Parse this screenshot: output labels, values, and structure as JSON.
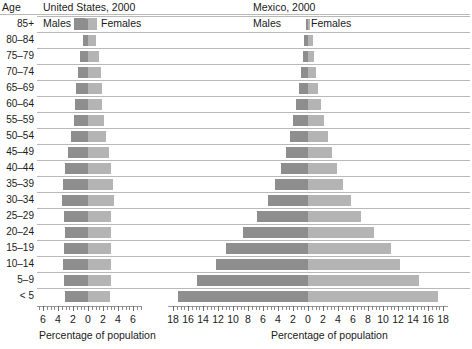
{
  "header": {
    "age_column_label": "Age",
    "left_title": "United States, 2000",
    "right_title": "Mexico, 2000"
  },
  "legend": {
    "left_males": "Males",
    "left_females": "Females",
    "right_males": "Males",
    "right_females": "Females",
    "male_color": "#8e8e8e",
    "female_color": "#b4b4b4"
  },
  "axis": {
    "left_title": "Percentage of population",
    "right_title": "Percentage of population",
    "left_tick_labels": [
      "6",
      "4",
      "2",
      "0",
      "2",
      "4",
      "6"
    ],
    "right_tick_labels": [
      "18",
      "16",
      "14",
      "12",
      "10",
      "8",
      "6",
      "4",
      "2",
      "0",
      "2",
      "4",
      "6",
      "8",
      "10",
      "12",
      "14",
      "16",
      "18"
    ],
    "left_limit": 7,
    "right_limit": 18,
    "tick_step": 2,
    "minor_tick_step": 0.5
  },
  "chart_data": {
    "type": "bar",
    "xlabel": "Percentage of population",
    "ylabel": "Age",
    "grid": true,
    "legend_position": "top",
    "categories": [
      "85+",
      "80–84",
      "75–79",
      "70–74",
      "65–69",
      "60–64",
      "55–59",
      "50–54",
      "45–49",
      "40–44",
      "35–39",
      "30–34",
      "25–29",
      "20–24",
      "15–19",
      "10–14",
      "5–9",
      "< 5"
    ],
    "panels": [
      {
        "name": "United States, 2000",
        "xlim": [
          -7,
          7
        ],
        "series": [
          {
            "name": "Males",
            "values": [
              0.5,
              0.7,
              1.1,
              1.4,
              1.6,
              1.7,
              1.9,
              2.3,
              2.7,
              3.1,
              3.3,
              3.5,
              3.2,
              3.1,
              3.2,
              3.3,
              3.2,
              3.1
            ]
          },
          {
            "name": "Females",
            "values": [
              1.0,
              1.1,
              1.5,
              1.7,
              1.8,
              1.9,
              2.1,
              2.4,
              2.8,
              3.1,
              3.3,
              3.4,
              3.1,
              3.0,
              3.0,
              3.1,
              3.0,
              2.9
            ]
          }
        ]
      },
      {
        "name": "Mexico, 2000",
        "xlim": [
          -18,
          18
        ],
        "series": [
          {
            "name": "Males",
            "values": [
              0.3,
              0.5,
              0.7,
              0.9,
              1.2,
              1.6,
              2.0,
              2.4,
              3.0,
              3.6,
              4.4,
              5.4,
              6.8,
              8.7,
              11.0,
              12.3,
              14.8,
              17.4
            ]
          },
          {
            "name": "Females",
            "values": [
              0.3,
              0.6,
              0.8,
              1.0,
              1.3,
              1.7,
              2.1,
              2.6,
              3.2,
              3.9,
              4.7,
              5.7,
              7.0,
              8.8,
              11.0,
              12.3,
              14.8,
              17.3
            ]
          }
        ]
      }
    ]
  }
}
